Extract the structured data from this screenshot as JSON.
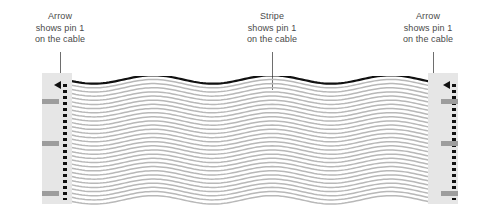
{
  "diagram": {
    "callouts": [
      {
        "id": "left",
        "line1": "Arrow",
        "line2": "shows pin 1",
        "line3": "on the cable"
      },
      {
        "id": "middle",
        "line1": "Stripe",
        "line2": "shows pin 1",
        "line3": "on the cable"
      },
      {
        "id": "right",
        "line1": "Arrow",
        "line2": "shows pin 1",
        "line3": "on the cable"
      }
    ]
  },
  "colors": {
    "background": "#ffffff",
    "text": "#4a4a4a",
    "leader_line": "#6e6e6e",
    "connector_body": "#e6e6e6",
    "connector_band": "#9d9d9d",
    "pin_marks": "#111111",
    "arrow_mark": "#111111",
    "pin1_stripe": "#111111",
    "conductor": "#b8b8b8"
  },
  "cable": {
    "conductor_count": 30,
    "pin1_stripe_position": "top",
    "wave_pattern": "horizontal sine"
  }
}
